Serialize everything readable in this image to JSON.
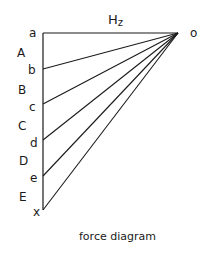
{
  "diagram": {
    "caption": "force diagram",
    "force_label_main": "H",
    "force_label_sub": "z",
    "pole_label": "o",
    "line_color": "#1a1a1a",
    "points": [
      {
        "label": "a",
        "x": 43,
        "y": 33
      },
      {
        "label": "b",
        "x": 43,
        "y": 69
      },
      {
        "label": "c",
        "x": 43,
        "y": 104
      },
      {
        "label": "d",
        "x": 43,
        "y": 140
      },
      {
        "label": "e",
        "x": 43,
        "y": 176
      },
      {
        "label": "x",
        "x": 43,
        "y": 210
      }
    ],
    "segment_labels": [
      "A",
      "B",
      "C",
      "D",
      "E"
    ],
    "pole": {
      "x": 178,
      "y": 33
    }
  }
}
